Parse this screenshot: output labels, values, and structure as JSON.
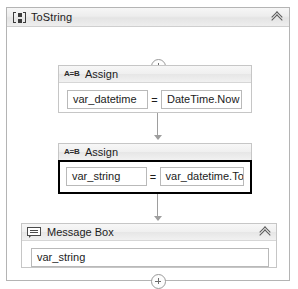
{
  "sequence": {
    "title": "ToString",
    "icon": "sequence-icon",
    "collapse_icon": "double-chevron-up-icon"
  },
  "connectors": {
    "top_plus": "plus-circle-icon",
    "bottom_plus": "plus-circle-icon"
  },
  "activities": [
    {
      "id": "assign-1",
      "icon": "assign-ab-icon",
      "title": "Assign",
      "selected": false,
      "left_value": "var_datetime",
      "operator": "=",
      "right_value": "DateTime.Now"
    },
    {
      "id": "assign-2",
      "icon": "assign-ab-icon",
      "title": "Assign",
      "selected": true,
      "left_value": "var_string",
      "operator": "=",
      "right_value": "var_datetime.ToStr"
    }
  ],
  "message_box": {
    "icon": "message-bubble-icon",
    "title": "Message Box",
    "collapse_icon": "double-chevron-up-icon",
    "value": "var_string"
  }
}
